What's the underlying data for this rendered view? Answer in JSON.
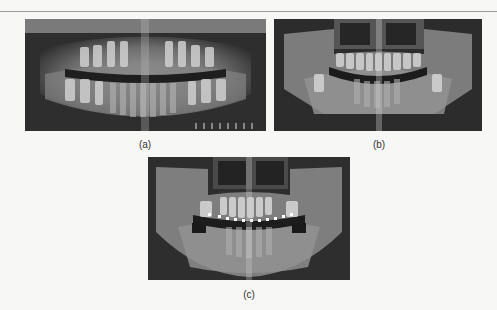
{
  "figure": {
    "panels": [
      {
        "id": "a",
        "label": "(a)",
        "description": "Panoramic dental radiograph - mixed dentition"
      },
      {
        "id": "b",
        "label": "(b)",
        "description": "Panoramic dental radiograph - permanent dentition"
      },
      {
        "id": "c",
        "label": "(c)",
        "description": "Panoramic dental radiograph - with orthodontic brackets"
      }
    ]
  }
}
